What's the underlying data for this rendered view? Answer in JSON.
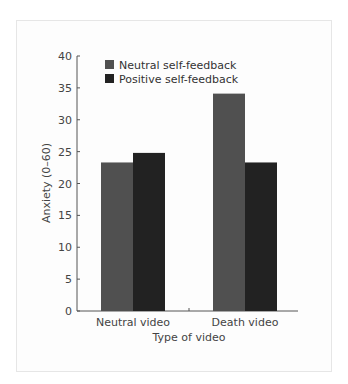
{
  "chart_data": {
    "type": "bar",
    "title": "",
    "xlabel": "Type of video",
    "ylabel": "Anxiety (0–60)",
    "ylim": [
      0,
      40
    ],
    "yticks": [
      0,
      5,
      10,
      15,
      20,
      25,
      30,
      35,
      40
    ],
    "categories": [
      "Neutral video",
      "Death video"
    ],
    "series": [
      {
        "name": "Neutral self-feedback",
        "color": "#505050",
        "values": [
          23.3,
          34.1
        ]
      },
      {
        "name": "Positive self-feedback",
        "color": "#222222",
        "values": [
          24.8,
          23.3
        ]
      }
    ],
    "grid": false,
    "legend_position": "top-left inside"
  },
  "labels": {
    "ylabel": "Anxiety (0–60)",
    "xlabel": "Type of video",
    "cat0": "Neutral video",
    "cat1": "Death video",
    "legend0": "Neutral self-feedback",
    "legend1": "Positive self-feedback",
    "yt0": "0",
    "yt5": "5",
    "yt10": "10",
    "yt15": "15",
    "yt20": "20",
    "yt25": "25",
    "yt30": "30",
    "yt35": "35",
    "yt40": "40"
  }
}
